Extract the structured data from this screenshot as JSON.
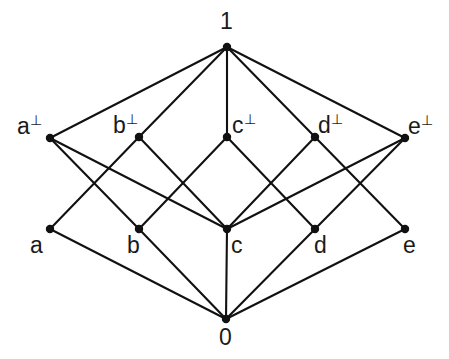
{
  "diagram": {
    "type": "hasse-lattice",
    "background_color": "#ffffff",
    "line_color": "#111111",
    "node_color": "#111111",
    "width": 449,
    "height": 359,
    "levels": [
      {
        "name": "top",
        "label": "1"
      },
      {
        "name": "coatoms",
        "label": "a⊥, b⊥, c⊥, d⊥, e⊥"
      },
      {
        "name": "atoms",
        "label": "a, b, c, d, e"
      },
      {
        "name": "bottom",
        "label": "0"
      }
    ],
    "nodes": [
      {
        "id": "one",
        "label": "1",
        "perp": "",
        "x": 227,
        "y": 47,
        "label_x": 220,
        "label_y": 10,
        "level": "top"
      },
      {
        "id": "a_perp",
        "label": "a",
        "perp": "⊥",
        "x": 50,
        "y": 138,
        "label_x": 17,
        "label_y": 113,
        "level": "coatoms"
      },
      {
        "id": "b_perp",
        "label": "b",
        "perp": "⊥",
        "x": 139,
        "y": 137,
        "label_x": 113,
        "label_y": 112,
        "level": "coatoms"
      },
      {
        "id": "c_perp",
        "label": "c",
        "perp": "⊥",
        "x": 227,
        "y": 137,
        "label_x": 232,
        "label_y": 112,
        "level": "coatoms"
      },
      {
        "id": "d_perp",
        "label": "d",
        "perp": "⊥",
        "x": 315,
        "y": 137,
        "label_x": 318,
        "label_y": 112,
        "level": "coatoms"
      },
      {
        "id": "e_perp",
        "label": "e",
        "perp": "⊥",
        "x": 405,
        "y": 138,
        "label_x": 408,
        "label_y": 113,
        "level": "coatoms"
      },
      {
        "id": "a",
        "label": "a",
        "perp": "",
        "x": 50,
        "y": 229,
        "label_x": 30,
        "label_y": 234,
        "level": "atoms"
      },
      {
        "id": "b",
        "label": "b",
        "perp": "",
        "x": 139,
        "y": 229,
        "label_x": 127,
        "label_y": 234,
        "level": "atoms"
      },
      {
        "id": "c",
        "label": "c",
        "perp": "",
        "x": 227,
        "y": 229,
        "label_x": 231,
        "label_y": 234,
        "level": "atoms"
      },
      {
        "id": "d",
        "label": "d",
        "perp": "",
        "x": 315,
        "y": 229,
        "label_x": 314,
        "label_y": 234,
        "level": "atoms"
      },
      {
        "id": "e",
        "label": "e",
        "perp": "",
        "x": 405,
        "y": 229,
        "label_x": 403,
        "label_y": 234,
        "level": "atoms"
      },
      {
        "id": "zero",
        "label": "0",
        "perp": "",
        "x": 226,
        "y": 319,
        "label_x": 219,
        "label_y": 326,
        "level": "bottom"
      }
    ],
    "edges": [
      {
        "from": "one",
        "to": "a_perp"
      },
      {
        "from": "one",
        "to": "b_perp"
      },
      {
        "from": "one",
        "to": "c_perp"
      },
      {
        "from": "one",
        "to": "d_perp"
      },
      {
        "from": "one",
        "to": "e_perp"
      },
      {
        "from": "a_perp",
        "to": "b"
      },
      {
        "from": "a_perp",
        "to": "c"
      },
      {
        "from": "b_perp",
        "to": "a"
      },
      {
        "from": "b_perp",
        "to": "c"
      },
      {
        "from": "c_perp",
        "to": "b"
      },
      {
        "from": "c_perp",
        "to": "d"
      },
      {
        "from": "d_perp",
        "to": "c"
      },
      {
        "from": "d_perp",
        "to": "e"
      },
      {
        "from": "e_perp",
        "to": "c"
      },
      {
        "from": "e_perp",
        "to": "d"
      },
      {
        "from": "a",
        "to": "zero"
      },
      {
        "from": "b",
        "to": "zero"
      },
      {
        "from": "c",
        "to": "zero"
      },
      {
        "from": "d",
        "to": "zero"
      },
      {
        "from": "e",
        "to": "zero"
      }
    ]
  }
}
